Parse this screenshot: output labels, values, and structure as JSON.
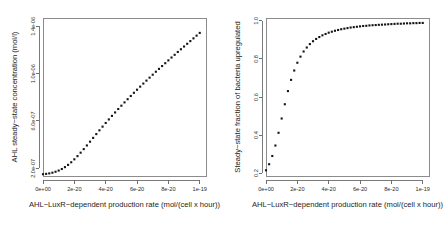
{
  "figure": {
    "background_color": "#ffffff",
    "point_color": "#141414",
    "axis_color": "#7a7a7a",
    "panel_count": 2
  },
  "chart_data": [
    {
      "type": "scatter",
      "panel": "left",
      "title": "",
      "xlabel": "AHL-LuxR-dependent production rate (mol/(cell x hour))",
      "ylabel": "AHL steady-state concentration (mol/l)",
      "xlim": [
        0,
        1.04e-19
      ],
      "ylim": [
        1.35e-07,
        1.47e-06
      ],
      "grid": false,
      "legend": null,
      "xticks": [
        0,
        2e-20,
        4e-20,
        6e-20,
        8e-20,
        1e-19
      ],
      "xticklabels": [
        "0e+00",
        "2e-20",
        "4e-20",
        "6e-20",
        "8e-20",
        "1e-19"
      ],
      "yticks": [
        2e-07,
        6e-07,
        1e-06,
        1.4e-06
      ],
      "yticklabels": [
        "2.0e-07",
        "6.0e-07",
        "1.0e-06",
        "1.4e-06"
      ],
      "x": [
        0,
        2e-21,
        4e-21,
        6e-21,
        8e-21,
        1e-20,
        1.2e-20,
        1.4e-20,
        1.6e-20,
        1.8e-20,
        2e-20,
        2.2e-20,
        2.4e-20,
        2.6e-20,
        2.8e-20,
        3e-20,
        3.2e-20,
        3.4e-20,
        3.6e-20,
        3.8e-20,
        4e-20,
        4.2e-20,
        4.4e-20,
        4.6e-20,
        4.8e-20,
        5e-20,
        5.2e-20,
        5.4e-20,
        5.6e-20,
        5.8e-20,
        6e-20,
        6.2e-20,
        6.4e-20,
        6.6e-20,
        6.8e-20,
        7e-20,
        7.2e-20,
        7.4e-20,
        7.6e-20,
        7.8e-20,
        8e-20,
        8.2e-20,
        8.4e-20,
        8.6e-20,
        8.8e-20,
        9e-20,
        9.2e-20,
        9.4e-20,
        9.6e-20,
        9.8e-20,
        1e-19
      ],
      "y": [
        1.5e-07,
        1.53e-07,
        1.57e-07,
        1.63e-07,
        1.71e-07,
        1.81e-07,
        1.94e-07,
        2.1e-07,
        2.29e-07,
        2.51e-07,
        2.76e-07,
        3.03e-07,
        3.32e-07,
        3.62e-07,
        3.93e-07,
        4.25e-07,
        4.57e-07,
        4.89e-07,
        5.21e-07,
        5.52e-07,
        5.83e-07,
        6.13e-07,
        6.43e-07,
        6.72e-07,
        7.01e-07,
        7.29e-07,
        7.57e-07,
        7.84e-07,
        8.11e-07,
        8.38e-07,
        8.64e-07,
        8.9e-07,
        9.16e-07,
        9.41e-07,
        9.66e-07,
        9.91e-07,
        1.016e-06,
        1.04e-06,
        1.064e-06,
        1.088e-06,
        1.112e-06,
        1.136e-06,
        1.159e-06,
        1.183e-06,
        1.206e-06,
        1.229e-06,
        1.252e-06,
        1.275e-06,
        1.298e-06,
        1.321e-06,
        1.344e-06
      ]
    },
    {
      "type": "scatter",
      "panel": "right",
      "title": "",
      "xlabel": "AHL-LuxR-dependent production rate (mol/(cell x hour))",
      "ylabel": "Steady-state fraction of bacteria upregulated",
      "xlim": [
        0,
        1.04e-19
      ],
      "ylim": [
        0.185,
        1.015
      ],
      "grid": false,
      "legend": null,
      "xticks": [
        0,
        2e-20,
        4e-20,
        6e-20,
        8e-20,
        1e-19
      ],
      "xticklabels": [
        "0e+00",
        "2e-20",
        "4e-20",
        "6e-20",
        "8e-20",
        "1e-19"
      ],
      "yticks": [
        0.2,
        0.4,
        0.6,
        0.8,
        1.0
      ],
      "yticklabels": [
        "0.2",
        "0.4",
        "0.6",
        "0.8",
        "1.0"
      ],
      "x": [
        0,
        2e-21,
        4e-21,
        6e-21,
        8e-21,
        1e-20,
        1.2e-20,
        1.4e-20,
        1.6e-20,
        1.8e-20,
        2e-20,
        2.2e-20,
        2.4e-20,
        2.6e-20,
        2.8e-20,
        3e-20,
        3.2e-20,
        3.4e-20,
        3.6e-20,
        3.8e-20,
        4e-20,
        4.2e-20,
        4.4e-20,
        4.6e-20,
        4.8e-20,
        5e-20,
        5.2e-20,
        5.4e-20,
        5.6e-20,
        5.8e-20,
        6e-20,
        6.2e-20,
        6.4e-20,
        6.6e-20,
        6.8e-20,
        7e-20,
        7.2e-20,
        7.4e-20,
        7.6e-20,
        7.8e-20,
        8e-20,
        8.2e-20,
        8.4e-20,
        8.6e-20,
        8.8e-20,
        9e-20,
        9.2e-20,
        9.4e-20,
        9.6e-20,
        9.8e-20,
        1e-19
      ],
      "y": [
        0.215,
        0.247,
        0.29,
        0.345,
        0.412,
        0.487,
        0.562,
        0.631,
        0.69,
        0.739,
        0.78,
        0.812,
        0.839,
        0.86,
        0.878,
        0.893,
        0.905,
        0.915,
        0.924,
        0.931,
        0.938,
        0.943,
        0.948,
        0.952,
        0.956,
        0.959,
        0.962,
        0.965,
        0.967,
        0.969,
        0.971,
        0.973,
        0.974,
        0.976,
        0.977,
        0.978,
        0.979,
        0.98,
        0.981,
        0.982,
        0.983,
        0.984,
        0.985,
        0.985,
        0.986,
        0.987,
        0.987,
        0.988,
        0.988,
        0.989,
        0.989
      ]
    }
  ]
}
